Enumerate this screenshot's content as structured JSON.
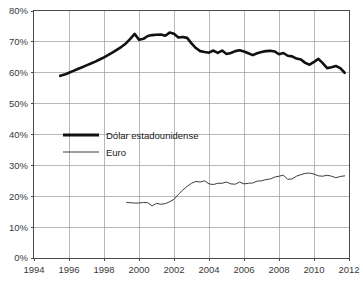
{
  "chart_data": {
    "type": "line",
    "title": "",
    "subtitle": "",
    "xlabel": "",
    "ylabel": "",
    "xlim": [
      1994,
      2012
    ],
    "ylim": [
      0,
      80
    ],
    "grid": true,
    "legend_position": "center-left",
    "x_ticks": [
      "1994",
      "1996",
      "1998",
      "2000",
      "2002",
      "2004",
      "2006",
      "2008",
      "2010",
      "2012"
    ],
    "x_tick_values": [
      1994,
      1996,
      1998,
      2000,
      2002,
      2004,
      2006,
      2008,
      2010,
      2012
    ],
    "y_ticks": [
      "0%",
      "10%",
      "20%",
      "30%",
      "40%",
      "50%",
      "60%",
      "70%",
      "80%"
    ],
    "y_tick_values": [
      0,
      10,
      20,
      30,
      40,
      50,
      60,
      70,
      80
    ],
    "series": [
      {
        "name": "Dólar estadounidense",
        "style": "thick",
        "color": "#111111",
        "x": [
          1995.5,
          1995.75,
          1996.0,
          1996.25,
          1996.5,
          1996.75,
          1997.0,
          1997.25,
          1997.5,
          1997.75,
          1998.0,
          1998.25,
          1998.5,
          1998.75,
          1999.0,
          1999.25,
          1999.5,
          1999.75,
          2000.0,
          2000.25,
          2000.5,
          2000.75,
          2001.0,
          2001.25,
          2001.5,
          2001.75,
          2002.0,
          2002.25,
          2002.5,
          2002.75,
          2003.0,
          2003.25,
          2003.5,
          2003.75,
          2004.0,
          2004.25,
          2004.5,
          2004.75,
          2005.0,
          2005.25,
          2005.5,
          2005.75,
          2006.0,
          2006.25,
          2006.5,
          2006.75,
          2007.0,
          2007.25,
          2007.5,
          2007.75,
          2008.0,
          2008.25,
          2008.5,
          2008.75,
          2009.0,
          2009.25,
          2009.5,
          2009.75,
          2010.0,
          2010.25,
          2010.5,
          2010.75,
          2011.0,
          2011.25,
          2011.5,
          2011.75
        ],
        "y": [
          59.0,
          59.4,
          60.0,
          60.6,
          61.2,
          61.8,
          62.4,
          63.0,
          63.6,
          64.3,
          65.0,
          65.8,
          66.6,
          67.5,
          68.4,
          69.5,
          71.0,
          72.6,
          70.7,
          71.0,
          71.9,
          72.2,
          72.3,
          72.4,
          72.0,
          73.0,
          72.6,
          71.4,
          71.6,
          71.3,
          69.5,
          68.0,
          67.0,
          66.7,
          66.5,
          67.2,
          66.4,
          67.2,
          66.1,
          66.4,
          67.0,
          67.3,
          66.9,
          66.3,
          65.7,
          66.3,
          66.7,
          67.0,
          67.1,
          66.9,
          66.0,
          66.4,
          65.5,
          65.3,
          64.6,
          64.3,
          63.2,
          62.6,
          63.5,
          64.5,
          63.1,
          61.5,
          61.8,
          62.2,
          61.5,
          60.0
        ]
      },
      {
        "name": "Euro",
        "style": "thin",
        "color": "#3d3d3d",
        "x": [
          1999.3,
          1999.5,
          1999.75,
          2000.0,
          2000.25,
          2000.5,
          2000.75,
          2001.0,
          2001.25,
          2001.5,
          2001.75,
          2002.0,
          2002.25,
          2002.5,
          2002.75,
          2003.0,
          2003.25,
          2003.5,
          2003.75,
          2004.0,
          2004.25,
          2004.5,
          2004.75,
          2005.0,
          2005.25,
          2005.5,
          2005.75,
          2006.0,
          2006.25,
          2006.5,
          2006.75,
          2007.0,
          2007.25,
          2007.5,
          2007.75,
          2008.0,
          2008.25,
          2008.5,
          2008.75,
          2009.0,
          2009.25,
          2009.5,
          2009.75,
          2010.0,
          2010.25,
          2010.5,
          2010.75,
          2011.0,
          2011.25,
          2011.5,
          2011.75
        ],
        "y": [
          18.0,
          17.9,
          17.8,
          17.8,
          18.0,
          17.9,
          16.9,
          17.7,
          17.4,
          17.6,
          18.2,
          19.0,
          20.6,
          22.0,
          23.2,
          24.2,
          24.8,
          24.6,
          25.0,
          24.0,
          23.8,
          24.2,
          24.2,
          24.6,
          24.0,
          23.9,
          24.6,
          24.0,
          24.2,
          24.3,
          24.9,
          25.0,
          25.4,
          25.6,
          26.2,
          26.5,
          26.8,
          25.5,
          25.6,
          26.5,
          27.0,
          27.4,
          27.5,
          27.2,
          26.6,
          26.5,
          26.8,
          26.5,
          26.0,
          26.4,
          26.6
        ]
      }
    ],
    "legend": [
      {
        "label": "Dólar estadounidense",
        "style": "thick"
      },
      {
        "label": "Euro",
        "style": "thin"
      }
    ]
  }
}
